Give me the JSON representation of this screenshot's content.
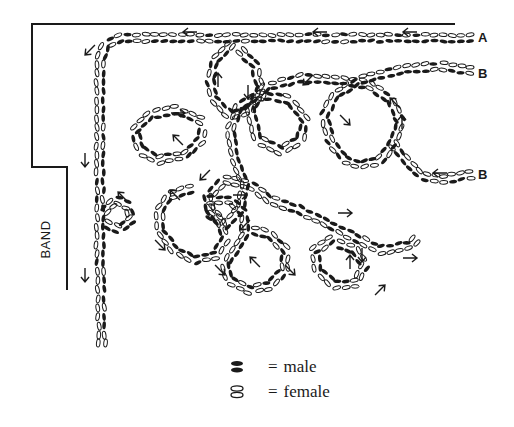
{
  "diagram": {
    "colors": {
      "ink": "#1a1a1a",
      "paper": "#ffffff"
    },
    "labels": {
      "band": "BAND",
      "a": "A",
      "b_upper": "B",
      "b_lower": "B"
    },
    "legend": [
      {
        "symbol": "male-icon",
        "equals": "=",
        "label": "male"
      },
      {
        "symbol": "female-icon",
        "equals": "=",
        "label": "female"
      }
    ],
    "boundary": [
      [
        455,
        24
      ],
      [
        32,
        24
      ],
      [
        32,
        167
      ],
      [
        67,
        167
      ],
      [
        67,
        290
      ]
    ],
    "paths": [
      {
        "name": "line-a",
        "pts": [
          [
            470,
            38
          ],
          [
            300,
            38
          ],
          [
            120,
            38
          ],
          [
            105,
            45
          ],
          [
            100,
            60
          ],
          [
            100,
            150
          ],
          [
            100,
            260
          ],
          [
            102,
            350
          ]
        ]
      },
      {
        "name": "line-b-upper",
        "pts": [
          [
            470,
            70
          ],
          [
            440,
            66
          ],
          [
            400,
            70
          ],
          [
            360,
            80
          ],
          [
            335,
            95
          ],
          [
            325,
            115
          ],
          [
            330,
            140
          ],
          [
            345,
            160
          ],
          [
            360,
            165
          ],
          [
            380,
            160
          ],
          [
            395,
            140
          ],
          [
            400,
            120
          ],
          [
            390,
            100
          ],
          [
            370,
            85
          ],
          [
            340,
            80
          ],
          [
            300,
            78
          ],
          [
            265,
            88
          ],
          [
            250,
            110
          ],
          [
            258,
            140
          ],
          [
            280,
            150
          ],
          [
            300,
            140
          ],
          [
            305,
            120
          ],
          [
            290,
            100
          ],
          [
            260,
            95
          ],
          [
            240,
            105
          ],
          [
            230,
            130
          ],
          [
            235,
            160
          ],
          [
            245,
            185
          ],
          [
            240,
            210
          ],
          [
            225,
            225
          ],
          [
            210,
            215
          ],
          [
            208,
            195
          ],
          [
            225,
            180
          ],
          [
            250,
            185
          ],
          [
            270,
            200
          ],
          [
            300,
            210
          ],
          [
            330,
            225
          ],
          [
            360,
            240
          ],
          [
            380,
            250
          ],
          [
            410,
            245
          ],
          [
            420,
            235
          ]
        ]
      },
      {
        "name": "line-b-lower",
        "pts": [
          [
            470,
            175
          ],
          [
            440,
            180
          ],
          [
            420,
            175
          ],
          [
            405,
            160
          ],
          [
            390,
            140
          ]
        ]
      },
      {
        "name": "loop-left-top",
        "pts": [
          [
            230,
            45
          ],
          [
            215,
            60
          ],
          [
            210,
            80
          ],
          [
            215,
            100
          ],
          [
            230,
            115
          ],
          [
            250,
            110
          ],
          [
            260,
            90
          ],
          [
            255,
            65
          ],
          [
            240,
            50
          ]
        ]
      },
      {
        "name": "loop-left-mid",
        "pts": [
          [
            200,
            120
          ],
          [
            175,
            110
          ],
          [
            150,
            115
          ],
          [
            135,
            130
          ],
          [
            140,
            150
          ],
          [
            160,
            160
          ],
          [
            185,
            155
          ],
          [
            200,
            140
          ],
          [
            205,
            125
          ]
        ]
      },
      {
        "name": "loop-band",
        "pts": [
          [
            105,
            210
          ],
          [
            115,
            200
          ],
          [
            128,
            205
          ],
          [
            132,
            220
          ],
          [
            120,
            230
          ],
          [
            108,
            225
          ]
        ]
      },
      {
        "name": "loop-low-left",
        "pts": [
          [
            190,
            190
          ],
          [
            170,
            195
          ],
          [
            160,
            210
          ],
          [
            160,
            230
          ],
          [
            175,
            250
          ],
          [
            195,
            260
          ],
          [
            215,
            255
          ],
          [
            225,
            240
          ],
          [
            220,
            220
          ],
          [
            205,
            205
          ]
        ]
      },
      {
        "name": "loop-low-mid",
        "pts": [
          [
            210,
            200
          ],
          [
            230,
            200
          ],
          [
            245,
            215
          ],
          [
            245,
            235
          ],
          [
            235,
            250
          ],
          [
            225,
            265
          ],
          [
            230,
            280
          ],
          [
            250,
            290
          ],
          [
            270,
            285
          ],
          [
            285,
            270
          ],
          [
            285,
            250
          ],
          [
            270,
            235
          ],
          [
            250,
            230
          ]
        ]
      },
      {
        "name": "loop-low-right",
        "pts": [
          [
            330,
            240
          ],
          [
            315,
            250
          ],
          [
            318,
            270
          ],
          [
            335,
            285
          ],
          [
            355,
            283
          ],
          [
            365,
            265
          ],
          [
            355,
            250
          ],
          [
            340,
            245
          ]
        ]
      }
    ],
    "arrows": [
      {
        "x": 90,
        "y": 50,
        "dir": "down-left"
      },
      {
        "x": 85,
        "y": 160,
        "dir": "down"
      },
      {
        "x": 85,
        "y": 275,
        "dir": "down"
      },
      {
        "x": 123,
        "y": 197,
        "dir": "up-left"
      },
      {
        "x": 190,
        "y": 32,
        "dir": "left"
      },
      {
        "x": 320,
        "y": 32,
        "dir": "left"
      },
      {
        "x": 410,
        "y": 32,
        "dir": "left"
      },
      {
        "x": 218,
        "y": 80,
        "dir": "up"
      },
      {
        "x": 248,
        "y": 92,
        "dir": "down"
      },
      {
        "x": 178,
        "y": 113,
        "dir": "right"
      },
      {
        "x": 178,
        "y": 140,
        "dir": "up-left"
      },
      {
        "x": 205,
        "y": 175,
        "dir": "down-left"
      },
      {
        "x": 308,
        "y": 80,
        "dir": "down-left"
      },
      {
        "x": 395,
        "y": 103,
        "dir": "up-left"
      },
      {
        "x": 402,
        "y": 122,
        "dir": "up"
      },
      {
        "x": 345,
        "y": 120,
        "dir": "down-right"
      },
      {
        "x": 440,
        "y": 173,
        "dir": "left"
      },
      {
        "x": 175,
        "y": 195,
        "dir": "up-left"
      },
      {
        "x": 240,
        "y": 195,
        "dir": "right"
      },
      {
        "x": 245,
        "y": 225,
        "dir": "down-left"
      },
      {
        "x": 255,
        "y": 262,
        "dir": "up-left"
      },
      {
        "x": 290,
        "y": 270,
        "dir": "down-right"
      },
      {
        "x": 345,
        "y": 213,
        "dir": "right"
      },
      {
        "x": 350,
        "y": 262,
        "dir": "up"
      },
      {
        "x": 362,
        "y": 255,
        "dir": "down"
      },
      {
        "x": 380,
        "y": 290,
        "dir": "up-right"
      },
      {
        "x": 410,
        "y": 258,
        "dir": "right"
      },
      {
        "x": 160,
        "y": 245,
        "dir": "down-right"
      },
      {
        "x": 220,
        "y": 270,
        "dir": "down-right"
      }
    ]
  }
}
